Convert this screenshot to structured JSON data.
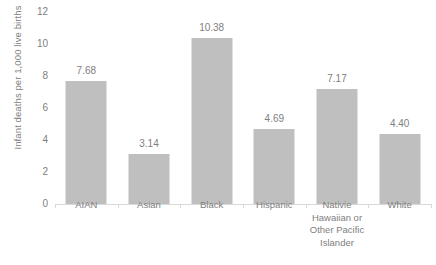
{
  "chart_data": {
    "type": "bar",
    "title": "",
    "subtitle": "",
    "xlabel": "",
    "ylabel": "Infant deaths per 1,000 live births",
    "ylim": [
      0,
      12
    ],
    "y_ticks": [
      "0",
      "2",
      "4",
      "6",
      "8",
      "10",
      "12"
    ],
    "grid": false,
    "legend": false,
    "legend_position": "none",
    "bar_color": "#BFBFBF",
    "axis_color": "#D9D9D9",
    "text_color": "#808080",
    "categories": [
      "AIAN",
      "Asian",
      "Black",
      "Hispanic",
      "Nativie Hawaiian or Other Pacific Islander",
      "White"
    ],
    "category_lines": [
      [
        "AIAN"
      ],
      [
        "Asian"
      ],
      [
        "Black"
      ],
      [
        "Hispanic"
      ],
      [
        "Nativie",
        "Hawaiian or",
        "Other Pacific",
        "Islander"
      ],
      [
        "White"
      ]
    ],
    "values": [
      7.68,
      3.14,
      10.38,
      4.69,
      7.17,
      4.4
    ],
    "value_labels": [
      "7.68",
      "3.14",
      "10.38",
      "4.69",
      "7.17",
      "4.40"
    ]
  }
}
